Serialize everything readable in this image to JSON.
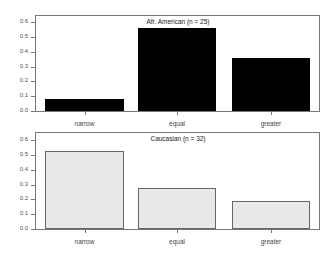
{
  "chart_data": [
    {
      "type": "bar",
      "title": "Afr. American (n = 25)",
      "categories": [
        "narrow",
        "equal",
        "greater"
      ],
      "values": [
        0.08,
        0.56,
        0.36
      ],
      "ylim": [
        0,
        0.65
      ],
      "yticks": [
        "0.0",
        "0.1",
        "0.2",
        "0.3",
        "0.4",
        "0.5",
        "0.6"
      ],
      "bar_color": "#000000",
      "xlabel": "",
      "ylabel": ""
    },
    {
      "type": "bar",
      "title": "Caucasian (n = 32)",
      "categories": [
        "narrow",
        "equal",
        "greater"
      ],
      "values": [
        0.53,
        0.28,
        0.19
      ],
      "ylim": [
        0,
        0.65
      ],
      "yticks": [
        "0.0",
        "0.1",
        "0.2",
        "0.3",
        "0.4",
        "0.5",
        "0.6"
      ],
      "bar_color": "#e8e8e8",
      "xlabel": "",
      "ylabel": ""
    }
  ]
}
